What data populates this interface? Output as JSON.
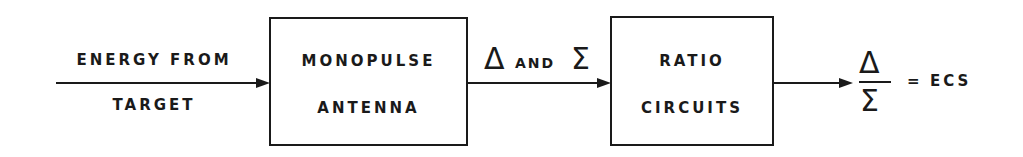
{
  "diagram": {
    "type": "block-diagram",
    "input": {
      "line1": "ENERGY FROM",
      "line2": "TARGET"
    },
    "blocks": [
      {
        "id": "antenna",
        "line1": "MONOPULSE",
        "line2": "ANTENNA"
      },
      {
        "id": "ratio",
        "line1": "RATIO",
        "line2": "CIRCUITS"
      }
    ],
    "connector": {
      "delta": "Δ",
      "and": "AND",
      "sigma": "Σ"
    },
    "output": {
      "numerator": "Δ",
      "denominator": "Σ",
      "equals": "=",
      "result": "ECS"
    }
  }
}
